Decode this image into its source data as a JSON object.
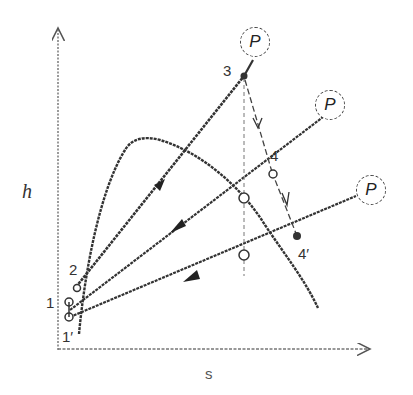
{
  "diagram": {
    "type": "h-s diagram (enthalpy-entropy) with refrigeration/throttling process lines",
    "axes": {
      "y_label": "h",
      "x_label": "s"
    },
    "state_points": [
      {
        "id": "1",
        "label": "1"
      },
      {
        "id": "1prime",
        "label": "1′"
      },
      {
        "id": "2",
        "label": "2"
      },
      {
        "id": "3",
        "label": "3"
      },
      {
        "id": "4",
        "label": "4"
      },
      {
        "id": "4prime",
        "label": "4′"
      }
    ],
    "isobars": [
      {
        "id": "p_high",
        "label": "P"
      },
      {
        "id": "p_mid",
        "label": "P"
      },
      {
        "id": "p_low",
        "label": "P"
      }
    ],
    "colors": {
      "ink": "#333333",
      "background": "#ffffff"
    }
  }
}
